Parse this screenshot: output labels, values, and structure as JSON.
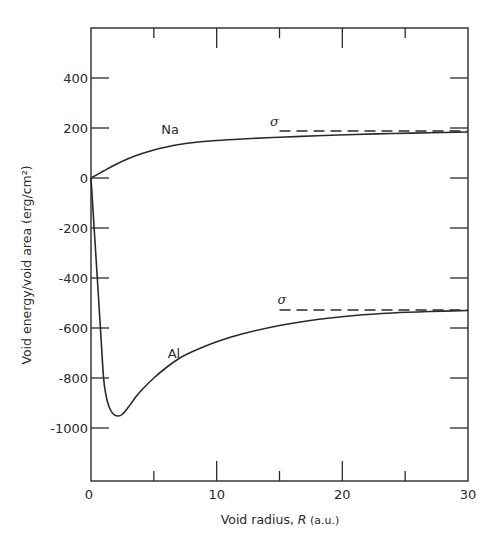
{
  "chart_data": {
    "type": "line",
    "title": "",
    "xlabel": "Void radius, R (a.u.)",
    "xlabel_parts": {
      "prefix": "Void radius, ",
      "var": "R",
      "unit": " (a.u.)"
    },
    "ylabel": "Void energy/void area (erg/cm²)",
    "xlim": [
      0,
      30
    ],
    "ylim": [
      -1210,
      600
    ],
    "x_ticks": [
      0,
      5,
      10,
      15,
      20,
      25,
      30
    ],
    "x_tick_labels": [
      "0",
      "10",
      "20",
      "30"
    ],
    "x_tick_label_values": [
      0,
      10,
      20,
      30
    ],
    "y_ticks": [
      400,
      200,
      0,
      -200,
      -400,
      -600,
      -800,
      -1000
    ],
    "y_tick_labels": [
      "400",
      "200",
      "0",
      "-200",
      "-400",
      "-600",
      "-800",
      "-1000"
    ],
    "grid": false,
    "legend": null,
    "series": [
      {
        "name": "Na",
        "style": "solid",
        "x": [
          0,
          1,
          2,
          3,
          4,
          5,
          6,
          7,
          8,
          10,
          12,
          15,
          18,
          21,
          24,
          27,
          30
        ],
        "y": [
          0,
          28,
          55,
          78,
          97,
          112,
          124,
          134,
          141,
          150,
          156,
          163,
          169,
          174,
          178,
          181,
          184
        ],
        "label_pos": {
          "x": 6.3,
          "y": 175
        }
      },
      {
        "name": "Al",
        "style": "solid",
        "x": [
          0,
          0.25,
          0.5,
          0.75,
          1.0,
          1.2,
          1.4,
          1.7,
          2.1,
          2.5,
          3.0,
          3.5,
          4.0,
          5.0,
          6.0,
          7.0,
          8.0,
          10.0,
          12.0,
          15.0,
          18.0,
          21.0,
          24.0,
          27.0,
          30.0
        ],
        "y": [
          0,
          -200,
          -400,
          -600,
          -800,
          -870,
          -910,
          -940,
          -952,
          -945,
          -915,
          -880,
          -850,
          -800,
          -758,
          -722,
          -696,
          -655,
          -624,
          -590,
          -566,
          -550,
          -540,
          -534,
          -530
        ],
        "label_pos": {
          "x": 6.6,
          "y": -720
        }
      }
    ],
    "annotations": [
      {
        "text": "σ",
        "series": "Na",
        "asymptote_y": 188,
        "line_style": "dashed",
        "x_start": 15,
        "x_end": 30,
        "label_x": 14.6,
        "label_y": 210
      },
      {
        "text": "σ",
        "series": "Al",
        "asymptote_y": -528,
        "line_style": "dashed",
        "x_start": 15,
        "x_end": 30,
        "label_x": 15.2,
        "label_y": -505
      }
    ]
  }
}
